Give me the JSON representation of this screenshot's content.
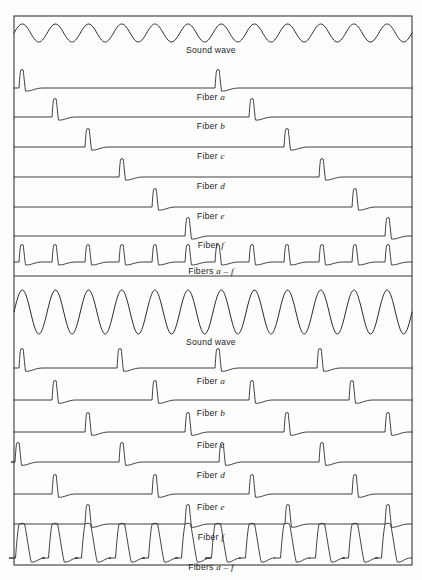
{
  "figure": {
    "domain": "diagram",
    "background_color": "#fdfdfc",
    "ink_color": "#2b2b2b",
    "frame": {
      "x": 14,
      "y": 16,
      "width": 398,
      "height": 549
    },
    "divider_y": 276
  },
  "panels": [
    {
      "id": "panel-top",
      "name": "low-rate-condition",
      "y_top": 16,
      "y_bottom": 276,
      "traces": [
        {
          "id": "top-sound-wave",
          "type": "sine",
          "label": "Sound wave",
          "label_italic_suffix": "",
          "baseline_y": 33,
          "amplitude": 9,
          "cycles": 12,
          "label_y": 45
        },
        {
          "id": "top-fiber-a",
          "type": "spike",
          "label": "Fiber",
          "label_italic_suffix": "a",
          "baseline_y": 88,
          "spike_height": 18,
          "spike_width": 7,
          "spikes_x": [
            22,
            218
          ],
          "label_y": 92
        },
        {
          "id": "top-fiber-b",
          "type": "spike",
          "label": "Fiber",
          "label_italic_suffix": "b",
          "baseline_y": 117,
          "spike_height": 18,
          "spike_width": 7,
          "spikes_x": [
            55,
            252
          ],
          "label_y": 121
        },
        {
          "id": "top-fiber-c",
          "type": "spike",
          "label": "Fiber",
          "label_italic_suffix": "c",
          "baseline_y": 147,
          "spike_height": 18,
          "spike_width": 7,
          "spikes_x": [
            88,
            287
          ],
          "label_y": 151
        },
        {
          "id": "top-fiber-d",
          "type": "spike",
          "label": "Fiber",
          "label_italic_suffix": "d",
          "baseline_y": 177,
          "spike_height": 18,
          "spike_width": 7,
          "spikes_x": [
            122,
            322
          ],
          "label_y": 181
        },
        {
          "id": "top-fiber-e",
          "type": "spike",
          "label": "Fiber",
          "label_italic_suffix": "e",
          "baseline_y": 207,
          "spike_height": 18,
          "spike_width": 7,
          "spikes_x": [
            155,
            355
          ],
          "label_y": 211
        },
        {
          "id": "top-fiber-f",
          "type": "spike",
          "label": "Fiber",
          "label_italic_suffix": "f",
          "baseline_y": 236,
          "spike_height": 18,
          "spike_width": 7,
          "spikes_x": [
            188,
            388
          ],
          "label_y": 240
        },
        {
          "id": "top-fibers-combined",
          "type": "spike",
          "label": "Fibers",
          "label_italic_suffix": "a – f",
          "baseline_y": 262,
          "spike_height": 17,
          "spike_width": 7,
          "spikes_x": [
            22,
            55,
            88,
            122,
            155,
            188,
            218,
            252,
            287,
            322,
            355,
            388
          ],
          "label_y": 266
        }
      ]
    },
    {
      "id": "panel-bottom",
      "name": "high-rate-condition",
      "y_top": 276,
      "y_bottom": 565,
      "traces": [
        {
          "id": "bottom-sound-wave",
          "type": "sine",
          "label": "Sound wave",
          "label_italic_suffix": "",
          "baseline_y": 312,
          "amplitude": 22,
          "cycles": 12,
          "label_y": 337
        },
        {
          "id": "bottom-fiber-a",
          "type": "spike",
          "label": "Fiber",
          "label_italic_suffix": "a",
          "baseline_y": 368,
          "spike_height": 19,
          "spike_width": 7,
          "spikes_x": [
            22,
            120,
            218,
            320
          ],
          "label_y": 376
        },
        {
          "id": "bottom-fiber-b",
          "type": "spike",
          "label": "Fiber",
          "label_italic_suffix": "b",
          "baseline_y": 400,
          "spike_height": 19,
          "spike_width": 7,
          "spikes_x": [
            55,
            155,
            252,
            352
          ],
          "label_y": 408
        },
        {
          "id": "bottom-fiber-c",
          "type": "spike",
          "label": "Fiber",
          "label_italic_suffix": "c",
          "baseline_y": 432,
          "spike_height": 19,
          "spike_width": 7,
          "spikes_x": [
            88,
            188,
            287,
            388
          ],
          "label_y": 440
        },
        {
          "id": "bottom-fiber-d",
          "type": "spike",
          "label": "Fiber",
          "label_italic_suffix": "d",
          "baseline_y": 462,
          "spike_height": 19,
          "spike_width": 7,
          "spikes_x": [
            18,
            122,
            222,
            322
          ],
          "label_y": 470
        },
        {
          "id": "bottom-fiber-e",
          "type": "spike",
          "label": "Fiber",
          "label_italic_suffix": "e",
          "baseline_y": 494,
          "spike_height": 19,
          "spike_width": 7,
          "spikes_x": [
            55,
            155,
            252,
            355
          ],
          "label_y": 502
        },
        {
          "id": "bottom-fiber-f",
          "type": "spike",
          "label": "Fiber",
          "label_italic_suffix": "f",
          "baseline_y": 524,
          "spike_height": 19,
          "spike_width": 7,
          "spikes_x": [
            88,
            188,
            288,
            388
          ],
          "label_y": 532
        },
        {
          "id": "bottom-fibers-combined",
          "type": "bigspike",
          "label": "Fibers",
          "label_italic_suffix": "a – f",
          "baseline_y": 558,
          "spike_height": 34,
          "spike_width": 13,
          "spikes_x": [
            22,
            55,
            88,
            122,
            155,
            188,
            218,
            252,
            287,
            322,
            355,
            388
          ],
          "label_y": 562
        }
      ]
    }
  ]
}
